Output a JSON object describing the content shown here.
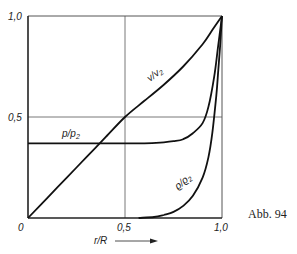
{
  "chart_data": {
    "type": "line",
    "title": "",
    "xlabel": "r/R",
    "ylabel": "",
    "xlim": [
      0,
      1.0
    ],
    "ylim": [
      0,
      1.0
    ],
    "grid": true,
    "x_ticks": [
      "0",
      "0,5",
      "1,0"
    ],
    "y_ticks": [
      "0",
      "0,5",
      "1,0"
    ],
    "caption": "Abb. 94",
    "legend": "inline curve labels",
    "series": [
      {
        "name": "v/v₂",
        "label_sub": "2",
        "x": [
          0,
          0.1,
          0.2,
          0.3,
          0.4,
          0.5,
          0.6,
          0.7,
          0.8,
          0.9,
          0.95,
          1.0
        ],
        "y": [
          0,
          0.1,
          0.2,
          0.3,
          0.4,
          0.5,
          0.58,
          0.66,
          0.75,
          0.86,
          0.93,
          1.0
        ]
      },
      {
        "name": "p/p₂",
        "label_sub": "2",
        "x": [
          0,
          0.2,
          0.4,
          0.6,
          0.7,
          0.75,
          0.8,
          0.85,
          0.9,
          0.93,
          0.96,
          0.98,
          1.0
        ],
        "y": [
          0.37,
          0.37,
          0.37,
          0.37,
          0.375,
          0.38,
          0.39,
          0.42,
          0.47,
          0.55,
          0.7,
          0.85,
          1.0
        ]
      },
      {
        "name": "ρ/ρ₂",
        "label_sub": "2",
        "x": [
          0.57,
          0.65,
          0.7,
          0.75,
          0.8,
          0.85,
          0.9,
          0.93,
          0.95,
          0.97,
          0.98,
          0.99,
          1.0
        ],
        "y": [
          0,
          0.005,
          0.015,
          0.03,
          0.06,
          0.11,
          0.2,
          0.3,
          0.42,
          0.6,
          0.72,
          0.85,
          1.0
        ]
      }
    ]
  },
  "labels": {
    "tick_y_top": "1,0",
    "tick_y_mid": "0,5",
    "tick_origin": "0",
    "tick_x_mid": "0,5",
    "tick_x_right": "1,0",
    "x_axis_label": "r/R",
    "v_label": "v/v",
    "v_sub": "2",
    "p_label": "p/p",
    "p_sub": "2",
    "rho_label": "ϱ/ϱ",
    "rho_sub": "2",
    "caption": "Abb. 94"
  },
  "colors": {
    "line": "#111111",
    "grid": "#555555",
    "text": "#222222"
  }
}
